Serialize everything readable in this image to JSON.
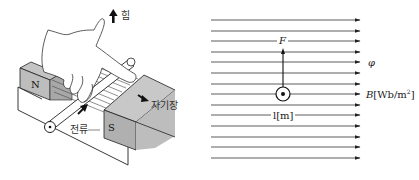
{
  "left_figure": {
    "title": "Fleming's left-hand rule illustration",
    "labels": {
      "force": "힘",
      "magnetic_field": "자기장",
      "current": "전류",
      "north_pole": "N",
      "south_pole": "S"
    },
    "colors": {
      "magnet_fill": "#b8b8b8",
      "line": "#222222"
    }
  },
  "right_figure": {
    "title": "Force on a conductor in a uniform magnetic field",
    "labels": {
      "force": "F",
      "flux": "φ",
      "flux_density": "B[Wb/m²]",
      "flux_density_symbol": "B",
      "flux_density_unit": "[Wb/m",
      "flux_density_exp": "2",
      "flux_density_close": "]",
      "length": "l[m]"
    },
    "field_line_count": 14,
    "field_lines_y": [
      20,
      31,
      41,
      52,
      62,
      73,
      84,
      94,
      105,
      115,
      126,
      137,
      147,
      158
    ],
    "conductor": {
      "x": 283,
      "y": 94,
      "direction": "out-of-page"
    }
  }
}
